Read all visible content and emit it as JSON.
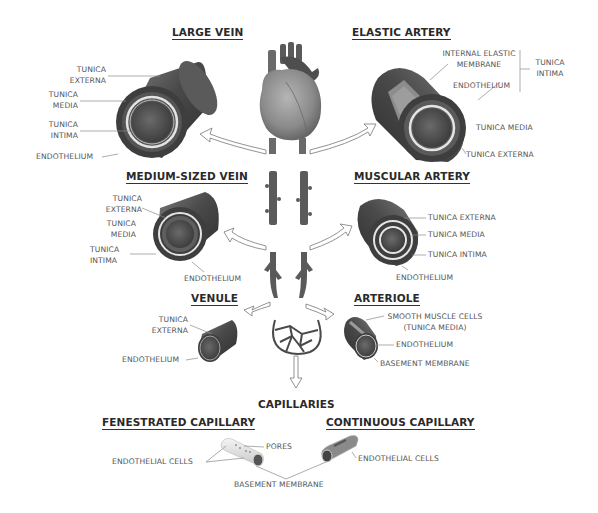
{
  "diagram": {
    "type": "anatomy-blood-vessels",
    "center": {
      "icon": "heart-icon",
      "description": "Human heart with descending artery and vein branches leading to capillary bed"
    },
    "sections": {
      "large_vein": {
        "title": "LARGE VEIN",
        "labels": [
          "TUNICA EXTERNA",
          "TUNICA MEDIA",
          "TUNICA INTIMA",
          "ENDOTHELIUM"
        ],
        "l1a": "TUNICA",
        "l1b": "EXTERNA",
        "l2a": "TUNICA",
        "l2b": "MEDIA",
        "l3a": "TUNICA",
        "l3b": "INTIMA",
        "l4": "ENDOTHELIUM"
      },
      "elastic_artery": {
        "title": "ELASTIC ARTERY",
        "l1a": "INTERNAL ELASTIC",
        "l1b": "MEMBRANE",
        "l2": "ENDOTHELIUM",
        "group_a": "TUNICA",
        "group_b": "INTIMA",
        "l3": "TUNICA MEDIA",
        "l4": "TUNICA EXTERNA"
      },
      "medium_vein": {
        "title": "MEDIUM-SIZED VEIN",
        "l1a": "TUNICA",
        "l1b": "EXTERNA",
        "l2a": "TUNICA",
        "l2b": "MEDIA",
        "l3a": "TUNICA",
        "l3b": "INTIMA",
        "l4": "ENDOTHELIUM"
      },
      "muscular_artery": {
        "title": "MUSCULAR ARTERY",
        "l1": "TUNICA EXTERNA",
        "l2": "TUNICA MEDIA",
        "l3": "TUNICA INTIMA",
        "l4": "ENDOTHELIUM"
      },
      "venule": {
        "title": "VENULE",
        "l1a": "TUNICA",
        "l1b": "EXTERNA",
        "l2": "ENDOTHELIUM"
      },
      "arteriole": {
        "title": "ARTERIOLE",
        "l1a": "SMOOTH MUSCLE CELLS",
        "l1b": "(TUNICA MEDIA)",
        "l2": "ENDOTHELIUM",
        "l3": "BASEMENT MEMBRANE"
      },
      "capillaries": {
        "title": "CAPILLARIES",
        "fenestrated": {
          "title": "FENESTRATED CAPILLARY",
          "pores": "PORES",
          "endothelial": "ENDOTHELIAL CELLS"
        },
        "continuous": {
          "title": "CONTINUOUS CAPILLARY",
          "endothelial": "ENDOTHELIAL CELLS"
        },
        "shared": "BASEMENT MEMBRANE"
      }
    },
    "colors": {
      "vessel_outer": "#4a4a4a",
      "vessel_mid": "#6e6e6e",
      "vessel_ring": "#e4e4e4",
      "lumen": "#505050",
      "leader_line": "#888888",
      "heading_text": "#2a2a2a",
      "label_text": "#555555"
    }
  }
}
